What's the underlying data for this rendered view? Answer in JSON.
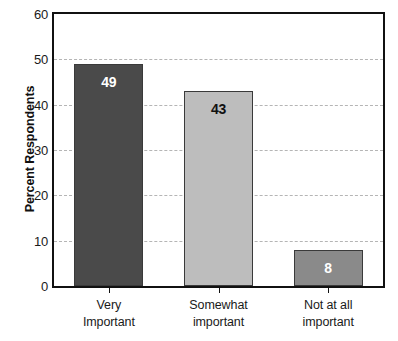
{
  "chart_data": {
    "type": "bar",
    "title": "",
    "subtitle": "",
    "xlabel": "",
    "ylabel": "Percent Respondents",
    "ylim": [
      0,
      60
    ],
    "ytick_step": 10,
    "yticks": [
      0,
      10,
      20,
      30,
      40,
      50,
      60
    ],
    "ytick_labels": [
      "0",
      "10",
      "20",
      "30",
      "40",
      "50",
      "60"
    ],
    "grid": "horizontal-dashed",
    "legend": "none",
    "categories": [
      "Very Important",
      "Somewhat important",
      "Not at all important"
    ],
    "category_lines": [
      [
        "Very",
        "Important"
      ],
      [
        "Somewhat",
        "important"
      ],
      [
        "Not at all",
        "important"
      ]
    ],
    "values": [
      49,
      43,
      8
    ],
    "value_labels": [
      "49",
      "43",
      "8"
    ],
    "bar_colors": [
      "#4a4a4a",
      "#bdbdbd",
      "#8a8a8a"
    ],
    "bar_label_colors": [
      "#ffffff",
      "#111111",
      "#ffffff"
    ],
    "bar_border_color": "#3a3a3a",
    "axis_color": "#111111",
    "gridline_color": "#a9a9a9",
    "background": "#ffffff"
  }
}
